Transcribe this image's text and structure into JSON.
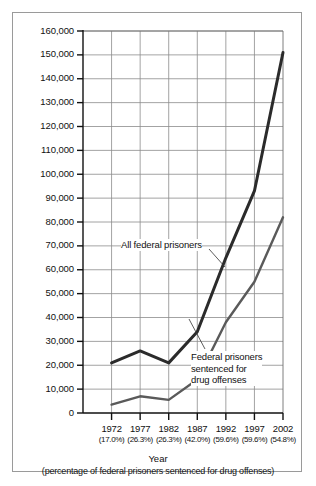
{
  "chart_data": {
    "type": "line",
    "title": "",
    "xlabel": "Year",
    "xlabel_note": "(percentage of federal prisoners sentenced for drug offenses)",
    "ylabel": "",
    "ylim": [
      0,
      160000
    ],
    "ytick_step": 10000,
    "grid": true,
    "legend": "annotations",
    "categories": [
      "1972",
      "1977",
      "1982",
      "1987",
      "1992",
      "1997",
      "2002"
    ],
    "category_notes": [
      "(17.0%)",
      "(26.3%)",
      "(26.3%)",
      "(42.0%)",
      "(59.6%)",
      "(59.6%)",
      "(54.8%)"
    ],
    "ytick_labels": [
      "160,000",
      "150,000",
      "140,000",
      "130,000",
      "120,000",
      "110,000",
      "100,000",
      "90,000",
      "80,000",
      "70,000",
      "60,000",
      "50,000",
      "40,000",
      "30,000",
      "20,000",
      "10,000",
      "0"
    ],
    "ytick_values": [
      160000,
      150000,
      140000,
      130000,
      120000,
      110000,
      100000,
      90000,
      80000,
      70000,
      60000,
      50000,
      40000,
      30000,
      20000,
      10000,
      0
    ],
    "series": [
      {
        "name": "All federal prisoners",
        "values": [
          21000,
          26000,
          21000,
          34000,
          65000,
          93000,
          151000
        ],
        "color": "#2b2b2b",
        "line_width": 3
      },
      {
        "name": "Federal prisoners sentenced for drug offenses",
        "values": [
          3500,
          7000,
          5500,
          14000,
          38000,
          55000,
          82000
        ],
        "color": "#5a5a5a",
        "line_width": 2.4
      }
    ],
    "annotations": [
      {
        "id": "upper-label",
        "lines": [
          "All federal prisoners"
        ],
        "points_to_series": "All federal prisoners"
      },
      {
        "id": "lower-label",
        "lines": [
          "Federal prisoners",
          "sentenced for",
          "drug offenses"
        ],
        "points_to_series": "Federal prisoners sentenced for drug offenses"
      }
    ]
  },
  "colors": {
    "grid": "#8c8c8c",
    "axis": "#111111",
    "frame": "#9a9a9a",
    "series_upper": "#2b2b2b",
    "series_lower": "#5a5a5a",
    "background": "#ffffff"
  }
}
